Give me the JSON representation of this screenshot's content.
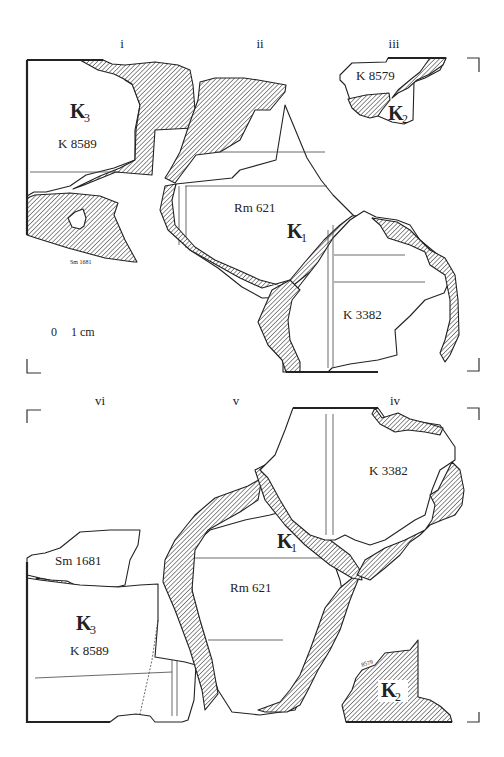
{
  "figure": {
    "top_panels": [
      {
        "id": "i",
        "label": "i"
      },
      {
        "id": "ii",
        "label": "ii"
      },
      {
        "id": "iii",
        "label": "iii"
      }
    ],
    "bottom_panels": [
      {
        "id": "vi",
        "label": "vi"
      },
      {
        "id": "v",
        "label": "v"
      },
      {
        "id": "iv",
        "label": "iv"
      }
    ],
    "fragments": {
      "k3_top": {
        "group": "K",
        "group_sub": "3",
        "number": "K 8589"
      },
      "k2_top": {
        "group": "K",
        "group_sub": "2",
        "number": "K 8579"
      },
      "k1_top": {
        "group": "K",
        "group_sub": "1",
        "number": "Rm 621"
      },
      "k3382_top": {
        "number": "K 3382"
      },
      "sm_top": {
        "number": "Sm 1681"
      },
      "k3_bottom": {
        "group": "K",
        "group_sub": "3",
        "number": "K 8589"
      },
      "sm_bottom": {
        "number": "Sm 1681"
      },
      "k1_bottom": {
        "group": "K",
        "group_sub": "1",
        "number": "Rm 621"
      },
      "k3382_bottom": {
        "number": "K 3382"
      },
      "k2_bottom": {
        "group": "K",
        "group_sub": "2",
        "number": "8579"
      }
    },
    "scale_bar": {
      "zero": "0",
      "unit_label": "1 cm"
    }
  }
}
